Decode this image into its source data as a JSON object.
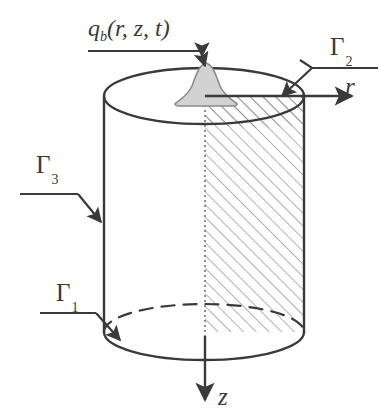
{
  "figure": {
    "type": "diagram",
    "background_color": "#ffffff",
    "line_color": "#3a3a3a",
    "hatch_color": "#808080",
    "blob_fill_color": "#d2d2d2",
    "blob_stroke_color": "#8a8a8a"
  },
  "labels": {
    "source_term": {
      "full": "q_b(r, z, t)",
      "base": "q",
      "subscript": "b",
      "arguments": "(r, z, t)",
      "role": "applied surface heat flux",
      "points_to": "bell-shaped source blob on top face"
    },
    "boundary_top": {
      "symbol": "Γ",
      "subscript": "2",
      "full": "Γ2",
      "role": "top boundary surface"
    },
    "boundary_side": {
      "symbol": "Γ",
      "subscript": "3",
      "full": "Γ3",
      "role": "lateral boundary surface"
    },
    "boundary_bottom": {
      "symbol": "Γ",
      "subscript": "1",
      "full": "Γ1",
      "role": "bottom boundary surface"
    },
    "axis_r": {
      "symbol": "r",
      "role": "radial coordinate axis",
      "direction": "right"
    },
    "axis_z": {
      "symbol": "z",
      "role": "axial coordinate axis",
      "direction": "down"
    }
  },
  "geometry": {
    "cylinder": {
      "top_ellipse_center": [
        204,
        96
      ],
      "bottom_ellipse_center": [
        204,
        332
      ],
      "ellipse_rx": 100,
      "ellipse_ry": 28,
      "left_wall_x": 104,
      "right_wall_x": 304,
      "hatched_section": "quarter cross-section between the central axis and the right wall"
    },
    "source_blob": {
      "center_x": 206,
      "base_y": 104,
      "apex_y": 64,
      "shape": "bell"
    }
  }
}
